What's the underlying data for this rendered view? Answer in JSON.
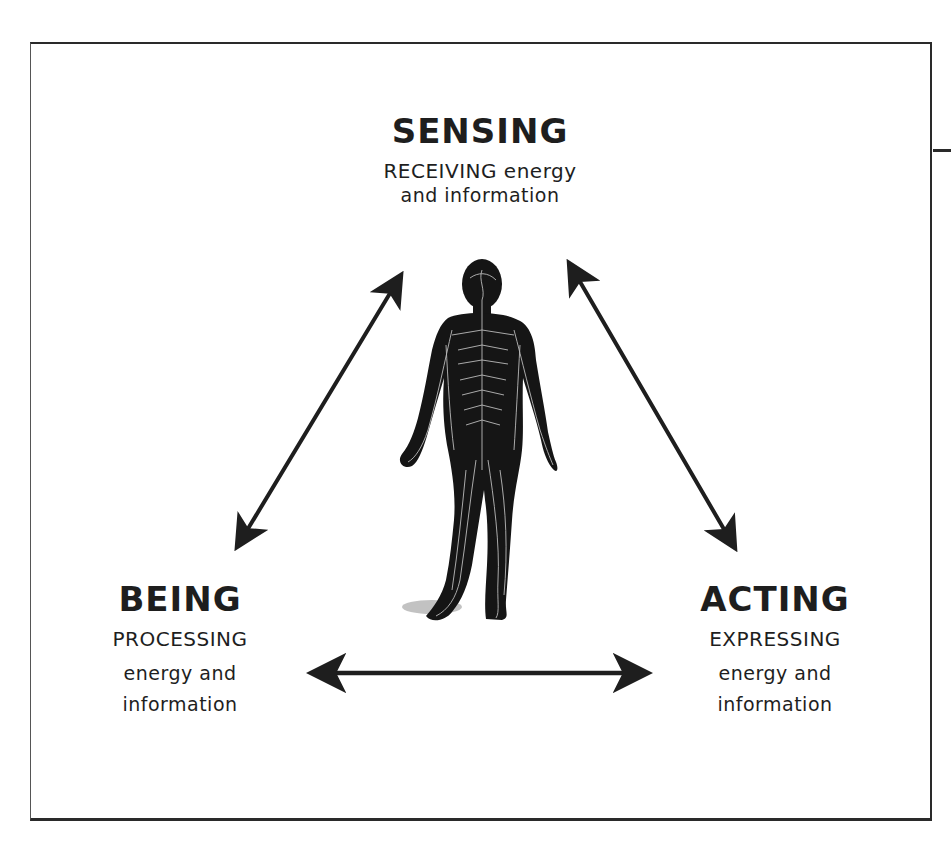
{
  "diagram": {
    "type": "triangle-cycle",
    "center_figure": "human nervous system illustration (back view)",
    "nodes": [
      {
        "id": "sensing",
        "title": "SENSING",
        "line1": "RECEIVING energy",
        "line2": "and information",
        "position": "top"
      },
      {
        "id": "being",
        "title": "BEING",
        "line1": "PROCESSING",
        "line2": "energy and",
        "line3": "information",
        "position": "bottom-left"
      },
      {
        "id": "acting",
        "title": "ACTING",
        "line1": "EXPRESSING",
        "line2": "energy and",
        "line3": "information",
        "position": "bottom-right"
      }
    ],
    "edges": [
      {
        "from": "sensing",
        "to": "being",
        "style": "double-arrow"
      },
      {
        "from": "sensing",
        "to": "acting",
        "style": "double-arrow"
      },
      {
        "from": "being",
        "to": "acting",
        "style": "double-arrow"
      }
    ],
    "colors": {
      "ink": "#1e1e1e",
      "background": "#ffffff",
      "nerve_lines": "#d8d8d8"
    }
  }
}
